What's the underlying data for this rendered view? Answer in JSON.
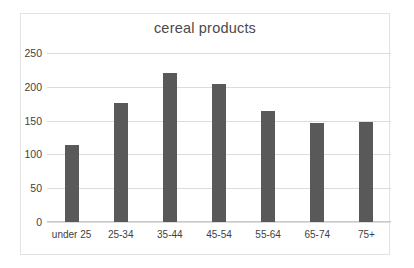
{
  "chart_data": {
    "type": "bar",
    "title": "cereal products",
    "xlabel": "",
    "ylabel": "",
    "categories": [
      "under 25",
      "25-34",
      "35-44",
      "45-54",
      "55-64",
      "65-74",
      "75+"
    ],
    "values": [
      114,
      176,
      220,
      204,
      164,
      146,
      148
    ],
    "series": [
      {
        "name": "cereal products",
        "values": [
          114,
          176,
          220,
          204,
          164,
          146,
          148
        ]
      }
    ],
    "ylim": [
      0,
      250
    ],
    "yticks": [
      0,
      50,
      100,
      150,
      200,
      250
    ],
    "ytick_labels": [
      "0",
      "50",
      "100",
      "150",
      "200",
      "250"
    ],
    "grid": true,
    "legend": false,
    "legend_position": "none",
    "bar_color": "#595959",
    "gridline_color": "#dcdcdc",
    "axis_color": "#c9c9c9",
    "text_color": "#3f3f3f",
    "title_color": "#4a4a4a",
    "background_color": "#ffffff",
    "border_color": "#e3e3e3"
  }
}
